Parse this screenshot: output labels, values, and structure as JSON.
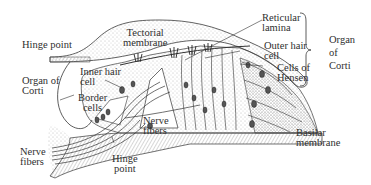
{
  "diagram": {
    "labels": {
      "hinge_point_top": "Hinge point",
      "tectorial_membrane": [
        "Tectorial",
        "membrane"
      ],
      "reticular_lamina": [
        "Reticular",
        "lamina"
      ],
      "outer_hair_cell": [
        "Outer hair",
        "cell"
      ],
      "cells_of_hensen": [
        "Cells of",
        "Hensen"
      ],
      "organ_of_corti_right": [
        "Organ",
        "of",
        "Corti"
      ],
      "organ_of_corti_left": [
        "Organ of",
        "Corti"
      ],
      "inner_hair_cell": [
        "Inner hair",
        "cell"
      ],
      "border_cells": [
        "Border",
        "cells"
      ],
      "nerve_fibers_center": [
        "Nerve",
        "fibers"
      ],
      "basilar_membrane": [
        "Basilar",
        "membrane"
      ],
      "nerve_fibers_left": [
        "Nerve",
        "fibers"
      ],
      "hinge_point_bottom": [
        "Hinge",
        "point"
      ]
    },
    "colors": {
      "ink": "#2f2f2f",
      "stipple": "#8a8a8a",
      "background": "#ffffff"
    }
  }
}
